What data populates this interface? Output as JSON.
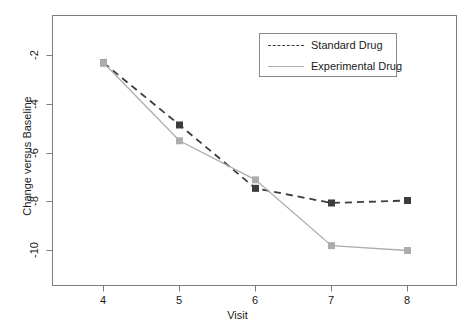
{
  "chart_data": {
    "type": "line",
    "title": "",
    "subtitle": "",
    "xlabel": "Visit",
    "ylabel": "Change versus Baseline",
    "x": [
      4,
      5,
      6,
      7,
      8
    ],
    "categories": [
      "4",
      "5",
      "6",
      "7",
      "8"
    ],
    "xtick_labels": [
      "4",
      "5",
      "6",
      "7",
      "8"
    ],
    "ytick_labels": [
      "-2",
      "-4",
      "-6",
      "-8",
      "-10"
    ],
    "ytick_values": [
      -2,
      -4,
      -6,
      -8,
      -10
    ],
    "xlim": [
      3.33,
      8.64
    ],
    "ylim": [
      -11.43,
      -1.36
    ],
    "grid": false,
    "legend_position": "top-right",
    "series": [
      {
        "name": "Standard Drug",
        "values": [
          -2.3,
          -4.85,
          -7.45,
          -8.05,
          -7.95
        ],
        "color": "#3c3c3c",
        "linestyle": "dashed",
        "marker": "square"
      },
      {
        "name": "Experimental Drug",
        "values": [
          -2.3,
          -5.5,
          -7.1,
          -9.8,
          -10.0
        ],
        "color": "#adadad",
        "linestyle": "solid",
        "marker": "square"
      }
    ]
  },
  "axes": {
    "x_title": "Visit",
    "y_title": "Change versus Baseline"
  },
  "legend": {
    "items": [
      {
        "label": "Standard Drug"
      },
      {
        "label": "Experimental Drug"
      }
    ]
  },
  "colors": {
    "standard_drug": "#3c3c3c",
    "experimental_drug": "#adadad",
    "axis": "#7a7d80",
    "text": "#1a1a1a",
    "background": "#ffffff"
  }
}
